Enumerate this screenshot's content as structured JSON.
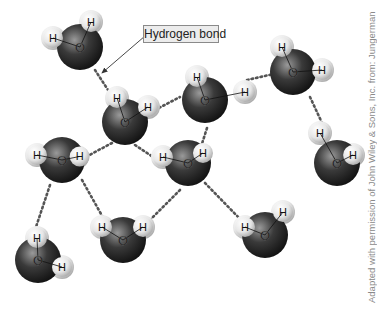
{
  "diagram": {
    "label": "Hydrogen bond",
    "credit": "Adapted with permission of John Wiley & Sons, Inc. from: Jungerman",
    "atom_labels": {
      "oxygen": "O",
      "hydrogen": "H"
    },
    "colors": {
      "oxygen": "#2a2a2a",
      "hydrogen": "#e8e8e8",
      "bond": "#555555",
      "label_bg": "#ececec"
    },
    "molecules": [
      {
        "id": 1,
        "o": [
          80,
          47
        ],
        "h": [
          [
            53,
            38
          ],
          [
            91,
            22
          ]
        ]
      },
      {
        "id": 2,
        "o": [
          125,
          122
        ],
        "h": [
          [
            117,
            98
          ],
          [
            148,
            107
          ]
        ]
      },
      {
        "id": 3,
        "o": [
          205,
          100
        ],
        "h": [
          [
            197,
            77
          ],
          [
            245,
            92
          ]
        ]
      },
      {
        "id": 4,
        "o": [
          293,
          72
        ],
        "h": [
          [
            282,
            47
          ],
          [
            322,
            70
          ]
        ]
      },
      {
        "id": 5,
        "o": [
          337,
          163
        ],
        "h": [
          [
            320,
            133
          ],
          [
            353,
            155
          ]
        ]
      },
      {
        "id": 6,
        "o": [
          62,
          160
        ],
        "h": [
          [
            37,
            155
          ],
          [
            77,
            157
          ]
        ]
      },
      {
        "id": 7,
        "o": [
          188,
          163
        ],
        "h": [
          [
            163,
            157
          ],
          [
            197,
            157
          ]
        ]
      },
      {
        "id": 8,
        "o": [
          265,
          235
        ],
        "h": [
          [
            245,
            227
          ],
          [
            283,
            212
          ]
        ]
      },
      {
        "id": 9,
        "o": [
          123,
          240
        ],
        "h": [
          [
            102,
            227
          ],
          [
            143,
            227
          ]
        ]
      },
      {
        "id": 10,
        "o": [
          38,
          260
        ],
        "h": [
          [
            37,
            238
          ],
          [
            62,
            267
          ]
        ]
      }
    ],
    "hydrogen_bonds": [
      [
        [
          95,
          70
        ],
        [
          110,
          93
        ]
      ],
      [
        [
          155,
          110
        ],
        [
          180,
          97
        ]
      ],
      [
        [
          247,
          80
        ],
        [
          278,
          73
        ]
      ],
      [
        [
          310,
          97
        ],
        [
          323,
          125
        ]
      ],
      [
        [
          207,
          128
        ],
        [
          200,
          150
        ]
      ],
      [
        [
          112,
          143
        ],
        [
          80,
          160
        ]
      ],
      [
        [
          135,
          145
        ],
        [
          165,
          165
        ]
      ],
      [
        [
          205,
          183
        ],
        [
          243,
          222
        ]
      ],
      [
        [
          180,
          190
        ],
        [
          145,
          225
        ]
      ],
      [
        [
          82,
          180
        ],
        [
          110,
          230
        ]
      ],
      [
        [
          50,
          185
        ],
        [
          35,
          230
        ]
      ]
    ]
  }
}
